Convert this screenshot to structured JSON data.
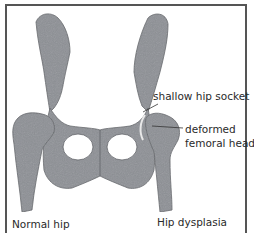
{
  "diagram": {
    "colors": {
      "bone": "#8d9095",
      "bone_shadow": "#6f7378",
      "frame": "#555555",
      "text": "#2a2a2a",
      "background": "#ffffff"
    },
    "annotations": {
      "shallow_socket": "shallow hip socket",
      "deformed_head_line1": "deformed",
      "deformed_head_line2": "femoral head"
    },
    "captions": {
      "left": "Normal hip",
      "right": "Hip dysplasia"
    }
  }
}
